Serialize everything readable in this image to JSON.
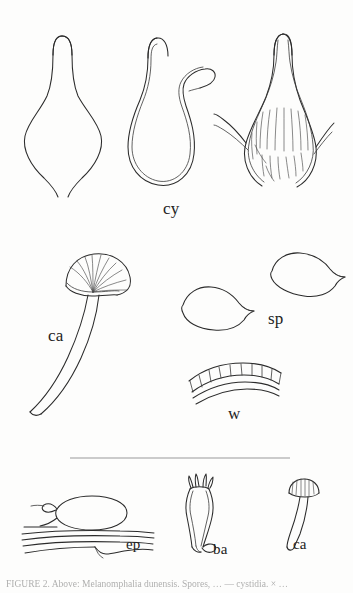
{
  "plate": {
    "kind": "mycological-line-drawing-plate",
    "background_color": "#fdfdfc",
    "ink_color": "#2b2b2b",
    "rule_color": "#9a9a9a"
  },
  "labels": {
    "cy": "cy",
    "ca_main": "ca",
    "sp": "sp",
    "w": "w",
    "ep": "ep",
    "ba": "ba",
    "ca_small": "ca"
  },
  "specimens": {
    "cystidia_row": {
      "label": "cy",
      "count": 3,
      "items": [
        {
          "name": "cystidium-lageniform",
          "description": "flask-shaped cystidium, single outline, long tapering neck"
        },
        {
          "name": "cystidium-lobed",
          "description": "double-walled cystidium with lateral finger-like lobe"
        },
        {
          "name": "cystidium-encrusted",
          "description": "thick-walled cystidium with internal striations and basal hyphal arms"
        }
      ]
    },
    "caulocystidium_large": {
      "label": "ca",
      "name": "caulocystidium-fan-headed",
      "description": "long curved stalk with ribbed fan-shaped apical head"
    },
    "spores": {
      "label": "sp",
      "count": 2,
      "name": "spore-apiculate",
      "description": "two smooth spores, each with a lateral apiculus"
    },
    "wall": {
      "label": "w",
      "name": "hymenium-wall-section",
      "description": "curved wall band with palisade of cells and arc lines below"
    },
    "epicutis": {
      "label": "ep",
      "name": "epicutis-element",
      "description": "inflated terminal cell with clamp connection above parallel hyphae"
    },
    "basidium": {
      "label": "ba",
      "name": "basidium-four-sterigmata",
      "description": "clavate basidium bearing four sterigmata with basal clamp"
    },
    "caulocystidium_small": {
      "label": "ca",
      "name": "caulocystidium-capitate",
      "description": "small mushroom-shaped caulocystidium with ribbed cap"
    }
  },
  "divider": {
    "name": "horizontal-rule",
    "x_start": 70,
    "x_end": 290,
    "y": 458
  },
  "caption": {
    "text": "FIGURE 2.  Above:  Melanomphalia dunensis.  Spores,  … — cystidia.  × …",
    "note_visible": "clipped at page edge"
  }
}
